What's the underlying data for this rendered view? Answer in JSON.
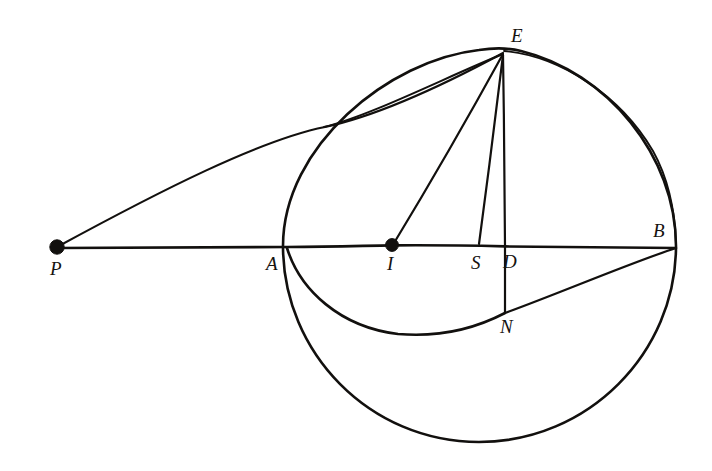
{
  "figure": {
    "background_color": "#ffffff",
    "ink_color": "#12100e",
    "width": 712,
    "height": 471
  },
  "labels": {
    "P": "P",
    "A": "A",
    "I": "I",
    "S": "S",
    "D": "D",
    "N": "N",
    "B": "B",
    "E": "E"
  },
  "points": [
    {
      "name": "P",
      "label": "P",
      "x": 57,
      "y": 248,
      "marked": true,
      "label_x": 50,
      "label_y": 259
    },
    {
      "name": "A",
      "label": "A",
      "x": 287,
      "y": 247,
      "marked": false,
      "label_x": 266,
      "label_y": 254
    },
    {
      "name": "I",
      "label": "I",
      "x": 392,
      "y": 245,
      "marked": true,
      "label_x": 387,
      "label_y": 254
    },
    {
      "name": "S",
      "label": "S",
      "x": 478,
      "y": 245,
      "marked": false,
      "label_x": 471,
      "label_y": 253
    },
    {
      "name": "D",
      "label": "D",
      "x": 505,
      "y": 247,
      "marked": false,
      "label_x": 503,
      "label_y": 252
    },
    {
      "name": "B",
      "label": "B",
      "x": 676,
      "y": 248,
      "marked": false,
      "label_x": 653,
      "label_y": 221
    },
    {
      "name": "E",
      "label": "E",
      "x": 503,
      "y": 52,
      "marked": false,
      "label_x": 511,
      "label_y": 26
    },
    {
      "name": "N",
      "label": "N",
      "x": 505,
      "y": 313,
      "marked": false,
      "label_x": 500,
      "label_y": 317
    }
  ],
  "shapes": {
    "main_circle": {
      "cx": 479,
      "cy": 246,
      "r": 196
    },
    "inner_arc": {
      "from": "A",
      "to": "N",
      "lowest_point_x": 398,
      "lowest_point_y": 334
    },
    "segments": [
      {
        "name": "axis-P-B",
        "from": "P",
        "to": "B"
      },
      {
        "name": "chord-P-E",
        "from": "P",
        "to": "E"
      },
      {
        "name": "radius-E-I",
        "from": "E",
        "to": "I"
      },
      {
        "name": "line-E-S",
        "from": "E",
        "to": "S"
      },
      {
        "name": "vertical-E-N",
        "from": "E",
        "to": "N"
      },
      {
        "name": "line-N-B",
        "from": "N",
        "to": "B"
      }
    ]
  }
}
